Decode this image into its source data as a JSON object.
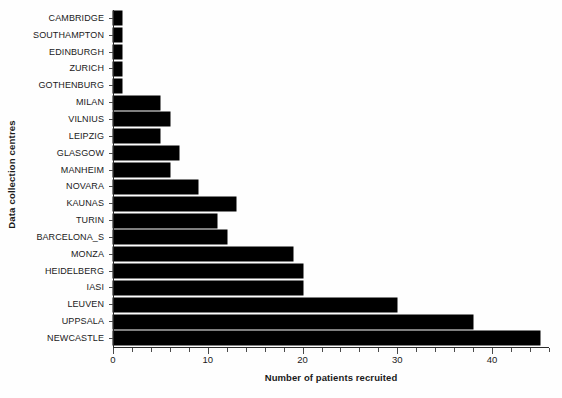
{
  "chart_data": {
    "type": "bar",
    "orientation": "horizontal",
    "title": "",
    "xlabel": "Number of patients recruited",
    "ylabel": "Data collection centres",
    "xlim": [
      0,
      46
    ],
    "ylim": null,
    "grid": false,
    "legend": null,
    "bar_color": "#000000",
    "background_color": "#ffffff",
    "xticks": [
      0,
      10,
      20,
      30,
      40
    ],
    "xtick_labels": [
      "0",
      "10",
      "20",
      "30",
      "40"
    ],
    "x_minor_tick_step": 2,
    "categories": [
      "CAMBRIDGE",
      "SOUTHAMPTON",
      "EDINBURGH",
      "ZURICH",
      "GOTHENBURG",
      "MILAN",
      "VILNIUS",
      "LEIPZIG",
      "GLASGOW",
      "MANHEIM",
      "NOVARA",
      "KAUNAS",
      "TURIN",
      "BARCELONA_S",
      "MONZA",
      "HEIDELBERG",
      "IASI",
      "LEUVEN",
      "UPPSALA",
      "NEWCASTLE"
    ],
    "values": [
      1,
      1,
      1,
      1,
      1,
      5,
      6,
      5,
      7,
      6,
      9,
      13,
      11,
      12,
      19,
      20,
      20,
      30,
      38,
      45
    ]
  }
}
